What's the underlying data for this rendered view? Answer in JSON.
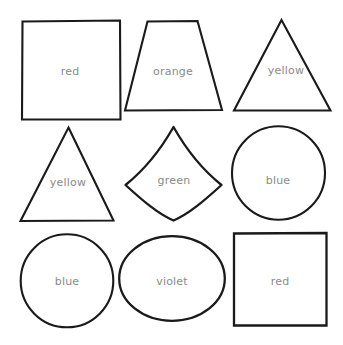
{
  "canvas": {
    "width": 343,
    "height": 345,
    "background": "#ffffff",
    "stroke_color": "#1a1a1a",
    "label_color": "#8a8a8a"
  },
  "sheet": {
    "title": "Shapes labelled with colour names",
    "grid": {
      "rows": 3,
      "columns": 3,
      "cell_count": 9
    }
  },
  "shapes": [
    {
      "id": "shape-1",
      "shape_name": "square",
      "label": "red",
      "row": 1,
      "column": 1,
      "label_x": 70,
      "label_y": 71,
      "stroke_width": 2.1
    },
    {
      "id": "shape-2",
      "shape_name": "trapezoid",
      "label": "orange",
      "row": 1,
      "column": 2,
      "label_x": 173,
      "label_y": 71,
      "stroke_width": 2.1
    },
    {
      "id": "shape-3",
      "shape_name": "triangle",
      "label": "yellow",
      "row": 1,
      "column": 3,
      "label_x": 286,
      "label_y": 70,
      "stroke_width": 2.1
    },
    {
      "id": "shape-4",
      "shape_name": "triangle",
      "label": "yellow",
      "row": 2,
      "column": 1,
      "label_x": 68,
      "label_y": 182,
      "stroke_width": 2.1
    },
    {
      "id": "shape-5",
      "shape_name": "reuleaux-triangle",
      "label": "green",
      "row": 2,
      "column": 2,
      "label_x": 174,
      "label_y": 180,
      "stroke_width": 2.3
    },
    {
      "id": "shape-6",
      "shape_name": "circle",
      "label": "blue",
      "row": 2,
      "column": 3,
      "label_x": 278,
      "label_y": 180,
      "stroke_width": 2.1
    },
    {
      "id": "shape-7",
      "shape_name": "circle",
      "label": "blue",
      "row": 3,
      "column": 1,
      "label_x": 67,
      "label_y": 281,
      "stroke_width": 2.1
    },
    {
      "id": "shape-8",
      "shape_name": "ellipse",
      "label": "violet",
      "row": 3,
      "column": 2,
      "label_x": 172,
      "label_y": 281,
      "stroke_width": 2.3
    },
    {
      "id": "shape-9",
      "shape_name": "square",
      "label": "red",
      "row": 3,
      "column": 3,
      "label_x": 280,
      "label_y": 281,
      "stroke_width": 2.3
    }
  ]
}
